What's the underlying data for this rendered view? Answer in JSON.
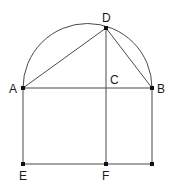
{
  "diagram": {
    "colors": {
      "line": "#4a4a4a",
      "point": "#111111",
      "label": "#1a1a1a",
      "background": "#ffffff"
    },
    "points": {
      "A": {
        "label": "A",
        "x": 23,
        "y": 88
      },
      "B": {
        "label": "B",
        "x": 152,
        "y": 88
      },
      "C": {
        "label": "C",
        "x": 106,
        "y": 88
      },
      "D": {
        "label": "D",
        "x": 106,
        "y": 28
      },
      "E": {
        "label": "E",
        "x": 23,
        "y": 164
      },
      "F": {
        "label": "F",
        "x": 106,
        "y": 164
      },
      "G": {
        "label": "",
        "x": 152,
        "y": 164
      }
    },
    "arc": {
      "description": "semicircle with diameter AB",
      "cx": 87.5,
      "cy": 88,
      "r": 64.5
    },
    "segments": [
      "AB",
      "AD",
      "DB",
      "DC",
      "CF",
      "AE",
      "BG",
      "EG"
    ],
    "labels": {
      "A": "A",
      "B": "B",
      "C": "C",
      "D": "D",
      "E": "E",
      "F": "F"
    }
  }
}
